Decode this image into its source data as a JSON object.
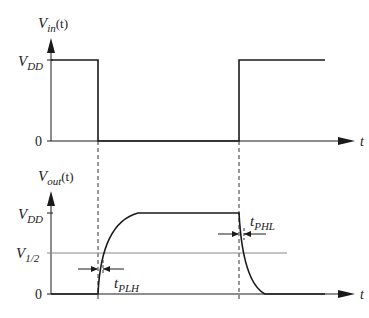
{
  "diagram": {
    "input_plot": {
      "y_label_main": "V",
      "y_label_sub": "in",
      "y_label_suffix": "(t)",
      "x_label": "t",
      "ticks": [
        {
          "main": "V",
          "sub": "DD"
        },
        {
          "main": "0",
          "sub": ""
        }
      ],
      "waveform": "high → fall at t1 → low → rise at t2 → high"
    },
    "output_plot": {
      "y_label_main": "V",
      "y_label_sub": "out",
      "y_label_suffix": "(t)",
      "x_label": "t",
      "ticks": [
        {
          "main": "V",
          "sub": "DD"
        },
        {
          "main": "V",
          "sub": "1/2"
        },
        {
          "main": "0",
          "sub": ""
        }
      ],
      "waveform": "low → exponential rise after t1 → high → exponential fall after t2 → low"
    },
    "annotations": [
      {
        "main": "t",
        "sub": "PLH",
        "desc": "low-to-high propagation delay"
      },
      {
        "main": "t",
        "sub": "PHL",
        "desc": "high-to-low propagation delay"
      }
    ],
    "colors": {
      "stroke": "#1a1a1a",
      "threshold_line": "#888888",
      "dashed": "#333333"
    }
  }
}
